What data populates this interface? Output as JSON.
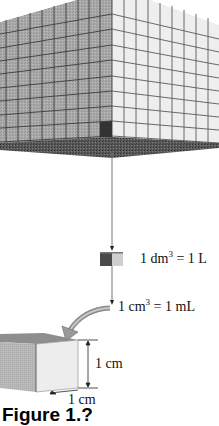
{
  "figure": {
    "title": "Figure 1.",
    "caption_visible_text": "Figure 1.?",
    "large_cube": {
      "description": "1 m cube subdivided into a 10x10 grid of 1 dm faces",
      "grid_divisions": 10,
      "colors": {
        "left_face": "#a9a9a9",
        "right_face": "#eeeeee",
        "bottom": "#555555",
        "grid": "#444444",
        "highlight_cell": "#3a3a3a"
      }
    },
    "small_cube_dm": {
      "label_prefix": "1 dm",
      "label_exp": "3",
      "label_suffix": " = 1 L"
    },
    "small_cube_cm": {
      "label_prefix": "1 cm",
      "label_exp": "3",
      "label_suffix": " = 1 mL"
    },
    "bottom_cube": {
      "height_label": "1 cm",
      "width_label": "1 cm",
      "colors": {
        "top": "#8c8c8c",
        "left": "#b9b9b9",
        "right": "#ececec"
      }
    },
    "arrow_color": "#999999"
  }
}
